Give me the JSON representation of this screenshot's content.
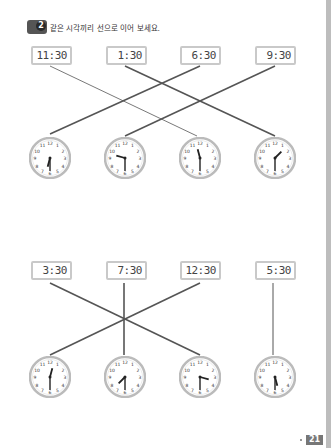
{
  "header": {
    "badge_number": "2",
    "instruction": "같은 시각끼리 선으로 이어 보세요."
  },
  "section1": {
    "digital": [
      "11:30",
      "1:30",
      "6:30",
      "9:30"
    ],
    "analog": [
      "6:30",
      "9:30",
      "11:30",
      "1:30"
    ]
  },
  "section2": {
    "digital": [
      "3:30",
      "7:30",
      "12:30",
      "5:30"
    ],
    "analog": [
      "12:30",
      "7:30",
      "3:30",
      "5:30"
    ]
  },
  "page_number": "21"
}
